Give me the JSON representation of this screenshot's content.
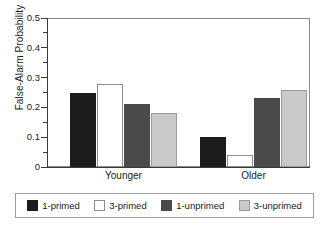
{
  "chart_data": {
    "type": "bar",
    "title": "",
    "xlabel": "",
    "ylabel": "False-Alarm Probability",
    "categories": [
      "Younger",
      "Older"
    ],
    "series": [
      {
        "name": "1-primed",
        "values": [
          0.25,
          0.1
        ],
        "color": "#1c1c1c"
      },
      {
        "name": "3-primed",
        "values": [
          0.28,
          0.04
        ],
        "color": "#ffffff"
      },
      {
        "name": "1-unprimed",
        "values": [
          0.21,
          0.23
        ],
        "color": "#4a4a4a"
      },
      {
        "name": "3-unprimed",
        "values": [
          0.18,
          0.26
        ],
        "color": "#c9c9c9"
      }
    ],
    "ylim": [
      0,
      0.5
    ],
    "ytick_labels": [
      "0",
      "0.1",
      "0.2",
      "0.3",
      "0.4",
      "0.5"
    ],
    "ytick_values": [
      0,
      0.1,
      0.2,
      0.3,
      0.4,
      0.5
    ],
    "yminor_values": [
      0.05,
      0.15,
      0.25,
      0.35,
      0.45
    ],
    "grid": false,
    "legend_position": "bottom"
  },
  "legend": {
    "items": [
      {
        "label": "1-primed"
      },
      {
        "label": "3-primed"
      },
      {
        "label": "1-unprimed"
      },
      {
        "label": "3-unprimed"
      }
    ]
  }
}
